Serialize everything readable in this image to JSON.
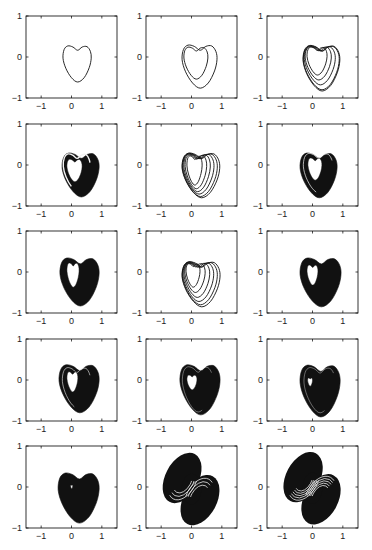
{
  "figure": {
    "background": "#ffffff",
    "rows": 5,
    "cols": 3,
    "ink_color": "#111111"
  },
  "chart_data": {
    "type": "line",
    "title": "",
    "xlabel": "",
    "ylabel": "",
    "xlim": [
      -1.5,
      1.5
    ],
    "ylim": [
      -1,
      1
    ],
    "xticks": [
      -1,
      0,
      1
    ],
    "yticks": [
      -1,
      0,
      1
    ],
    "xtick_labels": [
      "−1",
      "0",
      "1"
    ],
    "ytick_labels": [
      "−1",
      "0",
      "1"
    ],
    "grid": false,
    "legend": null,
    "panels": [
      {
        "index": 1,
        "row": 1,
        "col": 1,
        "style": "loops",
        "loops": [
          [
            -0.28,
            0.65,
            -0.61,
            0.27
          ]
        ]
      },
      {
        "index": 2,
        "row": 1,
        "col": 2,
        "style": "loops",
        "loops": [
          [
            -0.25,
            0.54,
            -0.54,
            0.24
          ],
          [
            -0.31,
            0.84,
            -0.76,
            0.29
          ]
        ]
      },
      {
        "index": 3,
        "row": 1,
        "col": 3,
        "style": "loops",
        "stroke_width": 1.1,
        "loops": [
          [
            -0.18,
            0.48,
            -0.44,
            0.24
          ],
          [
            -0.24,
            0.62,
            -0.56,
            0.25
          ],
          [
            -0.27,
            0.75,
            -0.68,
            0.26
          ],
          [
            -0.3,
            0.88,
            -0.8,
            0.27
          ],
          [
            -0.31,
            0.9,
            -0.83,
            0.28
          ]
        ]
      },
      {
        "index": 4,
        "row": 2,
        "col": 1,
        "style": "filled",
        "outer": [
          -0.31,
          0.91,
          -0.78,
          0.29
        ],
        "hole": [
          -0.15,
          0.35,
          -0.41,
          0.14
        ],
        "white_loops": [
          [
            -0.27,
            0.61,
            -0.63,
            0.27
          ]
        ],
        "white_width": 1.4
      },
      {
        "index": 5,
        "row": 2,
        "col": 2,
        "style": "loops",
        "loops": [
          [
            -0.15,
            0.35,
            -0.49,
            0.22
          ],
          [
            -0.21,
            0.5,
            -0.58,
            0.24
          ],
          [
            -0.25,
            0.62,
            -0.65,
            0.26
          ],
          [
            -0.28,
            0.74,
            -0.71,
            0.27
          ],
          [
            -0.3,
            0.85,
            -0.77,
            0.28
          ],
          [
            -0.31,
            0.93,
            -0.8,
            0.29
          ]
        ]
      },
      {
        "index": 6,
        "row": 2,
        "col": 3,
        "style": "filled",
        "outer": [
          -0.41,
          0.81,
          -0.8,
          0.29
        ],
        "hole": [
          -0.15,
          0.31,
          -0.37,
          0.17
        ],
        "white_loops": [
          [
            -0.3,
            0.66,
            -0.68,
            0.28
          ]
        ],
        "white_width": 0.7
      },
      {
        "index": 7,
        "row": 3,
        "col": 1,
        "style": "filled",
        "outer": [
          -0.38,
          0.91,
          -0.83,
          0.34
        ],
        "hole": [
          -0.15,
          0.25,
          -0.37,
          0.22
        ],
        "white_loops": [],
        "white_width": 0.6
      },
      {
        "index": 8,
        "row": 3,
        "col": 2,
        "style": "loops",
        "loops": [
          [
            -0.18,
            0.28,
            -0.37,
            0.2
          ],
          [
            -0.22,
            0.45,
            -0.5,
            0.21
          ],
          [
            -0.25,
            0.6,
            -0.62,
            0.22
          ],
          [
            -0.28,
            0.73,
            -0.72,
            0.23
          ],
          [
            -0.3,
            0.85,
            -0.8,
            0.24
          ],
          [
            -0.31,
            0.94,
            -0.85,
            0.25
          ]
        ]
      },
      {
        "index": 9,
        "row": 3,
        "col": 3,
        "style": "filled",
        "outer": [
          -0.41,
          0.94,
          -0.85,
          0.34
        ],
        "hole": [
          -0.18,
          0.18,
          -0.32,
          0.17
        ],
        "white_loops": [],
        "white_width": 0.6
      },
      {
        "index": 10,
        "row": 4,
        "col": 1,
        "style": "filled",
        "outer": [
          -0.41,
          0.91,
          -0.8,
          0.37
        ],
        "hole": [
          -0.15,
          0.21,
          -0.29,
          0.2
        ],
        "white_loops": [
          [
            -0.3,
            0.62,
            -0.68,
            0.3
          ]
        ],
        "white_width": 0.6
      },
      {
        "index": 11,
        "row": 4,
        "col": 2,
        "style": "filled",
        "outer": [
          -0.38,
          0.94,
          -0.85,
          0.37
        ],
        "hole": [
          -0.15,
          0.18,
          -0.24,
          0.12
        ],
        "white_loops": [
          [
            -0.3,
            0.7,
            -0.78,
            0.32
          ]
        ],
        "white_width": 0.4
      },
      {
        "index": 12,
        "row": 4,
        "col": 3,
        "style": "filled",
        "outer": [
          -0.41,
          0.91,
          -0.9,
          0.36
        ],
        "hole": [
          -0.16,
          0.0,
          -0.15,
          0.05
        ],
        "white_loops": [
          [
            -0.28,
            0.74,
            -0.8,
            0.3
          ]
        ],
        "white_width": 0.4
      },
      {
        "index": 13,
        "row": 5,
        "col": 1,
        "style": "filled",
        "outer": [
          -0.44,
          0.91,
          -0.88,
          0.34
        ],
        "hole": [
          -0.03,
          0.04,
          -0.04,
          0.05
        ],
        "white_loops": [],
        "white_width": 0.6
      },
      {
        "index": 14,
        "row": 5,
        "col": 2,
        "style": "double_scroll",
        "lobes": [
          {
            "cx": -0.31,
            "cy": 0.22,
            "rx": 0.55,
            "ry": 0.66,
            "rot": 28
          },
          {
            "cx": 0.28,
            "cy": -0.32,
            "rx": 0.55,
            "ry": 0.66,
            "rot": 28
          },
          {
            "cx": 0.0,
            "cy": -0.05,
            "rx": 0.32,
            "ry": 0.38,
            "rot": 0
          }
        ],
        "white_rings": 3
      },
      {
        "index": 15,
        "row": 5,
        "col": 3,
        "style": "double_scroll",
        "lobes": [
          {
            "cx": -0.31,
            "cy": 0.24,
            "rx": 0.56,
            "ry": 0.66,
            "rot": 28
          },
          {
            "cx": 0.28,
            "cy": -0.3,
            "rx": 0.56,
            "ry": 0.66,
            "rot": 28
          },
          {
            "cx": 0.0,
            "cy": -0.03,
            "rx": 0.32,
            "ry": 0.38,
            "rot": 0
          }
        ],
        "white_rings": 5
      }
    ]
  }
}
